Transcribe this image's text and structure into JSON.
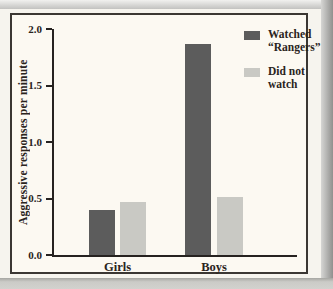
{
  "palette": {
    "page_background": "#f6f4ee",
    "figure_background": "#fcf9f2",
    "figure_border": "#3b3733",
    "axis": "#262220",
    "text": "#2a241d",
    "watched_bar": "#5c5c5c",
    "did_not_watch_bar": "#c9c9c4"
  },
  "chart_data": {
    "type": "bar",
    "title": "",
    "xlabel": "",
    "ylabel": "Aggressive responses per minute",
    "categories": [
      "Girls",
      "Boys"
    ],
    "series": [
      {
        "name": "Watched “Rangers”",
        "values": [
          0.4,
          1.87
        ],
        "color": "#5c5c5c"
      },
      {
        "name": "Did not watch",
        "values": [
          0.47,
          0.51
        ],
        "color": "#c9c9c4"
      }
    ],
    "ylim": [
      0.0,
      2.0
    ],
    "yticks": [
      {
        "value": 2.0,
        "label": "2.0"
      },
      {
        "value": 1.5,
        "label": "1.5"
      },
      {
        "value": 1.0,
        "label": "1.0"
      },
      {
        "value": 0.5,
        "label": "0.5"
      },
      {
        "value": 0.0,
        "label": "0.0"
      }
    ],
    "grid": false,
    "legend_position": "top-right",
    "legend": [
      {
        "label_lines": [
          "Watched",
          "“Rangers”"
        ],
        "color": "#5c5c5c"
      },
      {
        "label_lines": [
          "Did not",
          "watch"
        ],
        "color": "#c9c9c4"
      }
    ]
  }
}
